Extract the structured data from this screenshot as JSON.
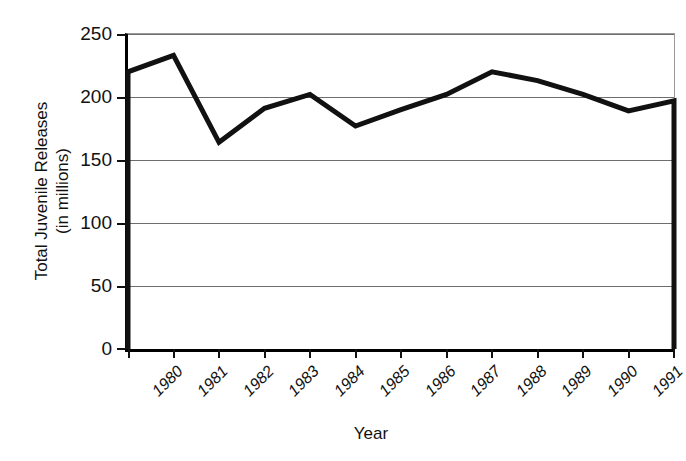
{
  "chart_data": {
    "type": "line",
    "title": "",
    "xlabel": "Year",
    "ylabel": "Total Juvenile Releases (in millions)",
    "ylabel_line1": "Total Juvenile Releases",
    "ylabel_line2": "(in millions)",
    "categories": [
      "1980",
      "1981",
      "1982",
      "1983",
      "1984",
      "1985",
      "1986",
      "1987",
      "1988",
      "1989",
      "1990",
      "1991",
      "1992"
    ],
    "values": [
      220,
      233,
      164,
      191,
      202,
      177,
      190,
      202,
      220,
      213,
      202,
      189,
      197
    ],
    "series": [
      {
        "name": "Total Juvenile Releases",
        "values": [
          220,
          233,
          164,
          191,
          202,
          177,
          190,
          202,
          220,
          213,
          202,
          189,
          197
        ]
      }
    ],
    "ylim": [
      0,
      250
    ],
    "yticks": [
      0,
      50,
      100,
      150,
      200,
      250
    ],
    "ytick_labels": [
      "0",
      "50",
      "100",
      "150",
      "200",
      "250"
    ],
    "grid": true,
    "grid_axis": "y",
    "legend": "none",
    "line_color": "#111111",
    "line_width": 5,
    "grid_color": "#6d6d6d",
    "axis_color": "#000000",
    "background": "#ffffff"
  },
  "axes": {
    "y_title_line1": "Total Juvenile Releases",
    "y_title_line2": "(in millions)",
    "x_title": "Year"
  }
}
